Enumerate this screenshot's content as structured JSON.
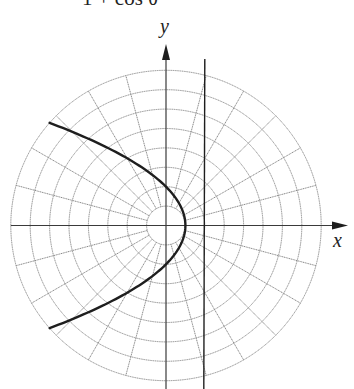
{
  "figure": {
    "formula_fragment": "1 + cos θ",
    "x_axis_label": "x",
    "y_axis_label": "y"
  },
  "chart_data": {
    "type": "polar-grid-curve",
    "title_visible_text": "1 + cos θ",
    "xlabel": "x",
    "ylabel": "y",
    "grid": {
      "rings": [
        1,
        2,
        3,
        4,
        5,
        6,
        7,
        8
      ],
      "radial_step_degrees": 15
    },
    "curve": {
      "name": "parabola",
      "equation": "r = 2 / (1 + cos θ)",
      "vertex": [
        1,
        0
      ],
      "x_range": [
        -6,
        1
      ]
    },
    "directrix": {
      "name": "directrix",
      "equation": "x = 2"
    },
    "colors": {
      "grid": "#8a8a8a",
      "curve": "#1e1e1e",
      "axis": "#3a3a3a"
    }
  }
}
